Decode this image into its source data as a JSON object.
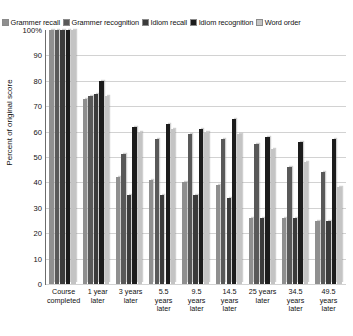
{
  "chart_data": {
    "type": "bar",
    "title": "",
    "xlabel": "",
    "ylabel": "Percent of original score",
    "ylim": [
      0,
      100
    ],
    "yticks": [
      "100%",
      "90",
      "80",
      "70",
      "60",
      "50",
      "40",
      "30",
      "20",
      "10",
      "0"
    ],
    "grid": true,
    "legend_position": "top",
    "categories": [
      "Course completed",
      "1 year later",
      "3 years later",
      "5.5 years later",
      "9.5 years later",
      "14.5 years later",
      "25 years later",
      "34.5 years later",
      "49.5 years later"
    ],
    "category_lines": [
      [
        "Course",
        "completed"
      ],
      [
        "1 year",
        "later"
      ],
      [
        "3 years",
        "later"
      ],
      [
        "5.5",
        "years",
        "later"
      ],
      [
        "9.5",
        "years",
        "later"
      ],
      [
        "14.5",
        "years",
        "later"
      ],
      [
        "25 years",
        "later"
      ],
      [
        "34.5",
        "years",
        "later"
      ],
      [
        "49.5",
        "years",
        "later"
      ]
    ],
    "series": [
      {
        "name": "Grammer recall",
        "color": "#8f8f8f",
        "values": [
          100,
          73,
          42,
          41,
          40,
          39,
          26,
          26,
          25
        ]
      },
      {
        "name": "Grammer recognition",
        "color": "#595959",
        "values": [
          100,
          74,
          51,
          57,
          59,
          57,
          55,
          46,
          44
        ]
      },
      {
        "name": "Idiom recall",
        "color": "#3b3b3b",
        "values": [
          100,
          75,
          35,
          35,
          35,
          34,
          26,
          26,
          25
        ]
      },
      {
        "name": "Idiom recognition",
        "color": "#1c1c1c",
        "values": [
          100,
          80,
          62,
          63,
          61,
          65,
          58,
          56,
          57
        ]
      },
      {
        "name": "Word order",
        "color": "#c4c4c4",
        "values": [
          100,
          74,
          60,
          61,
          60,
          59,
          53,
          48,
          38
        ]
      }
    ]
  },
  "legend": {
    "items": [
      {
        "label": "Grammer recall",
        "swatch": "#8f8f8f"
      },
      {
        "label": "Grammer recognition",
        "swatch": "#595959"
      },
      {
        "label": "Idiom recall",
        "swatch": "#3b3b3b"
      },
      {
        "label": "Idiom recognition",
        "swatch": "#1c1c1c"
      },
      {
        "label": "Word order",
        "swatch": "#c4c4c4"
      }
    ]
  }
}
